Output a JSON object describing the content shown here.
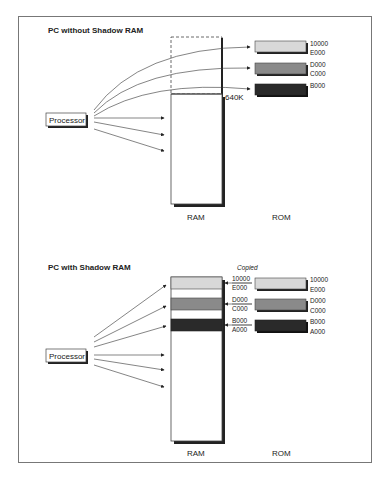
{
  "panels": [
    {
      "title": "PC without Shadow RAM",
      "processor_label": "Processor",
      "ram_label": "RAM",
      "rom_label": "ROM",
      "ram_marker": "640K",
      "rom_blocks": [
        {
          "top": "10000",
          "bottom": "E000",
          "color": "#d8d8d8"
        },
        {
          "top": "D000",
          "bottom": "C000",
          "color": "#8a8a8a"
        },
        {
          "top": "B000",
          "bottom": "",
          "color": "#2a2a2a"
        }
      ]
    },
    {
      "title": "PC with Shadow RAM",
      "processor_label": "Processor",
      "ram_label": "RAM",
      "rom_label": "ROM",
      "copied_label": "Copied",
      "ram_blocks": [
        {
          "top": "10000",
          "bottom": "E000",
          "color": "#d8d8d8"
        },
        {
          "top": "D000",
          "bottom": "C000",
          "color": "#8a8a8a"
        },
        {
          "top": "B000",
          "bottom": "A000",
          "color": "#2a2a2a"
        }
      ],
      "rom_blocks": [
        {
          "top": "10000",
          "bottom": "E000",
          "color": "#d8d8d8"
        },
        {
          "top": "D000",
          "bottom": "C000",
          "color": "#8a8a8a"
        },
        {
          "top": "B000",
          "bottom": "A000",
          "color": "#2a2a2a"
        }
      ]
    }
  ]
}
